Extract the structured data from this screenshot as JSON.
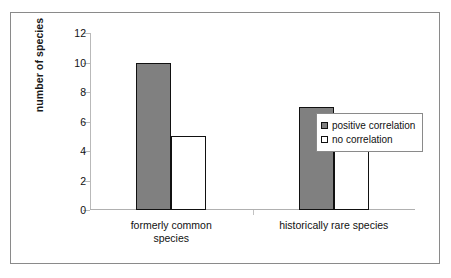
{
  "chart_data": {
    "type": "bar",
    "title": "",
    "xlabel": "",
    "ylabel": "number of species",
    "categories": [
      "formerly common species",
      "historically rare species"
    ],
    "category_lines": [
      [
        "formerly common",
        "species"
      ],
      [
        "historically rare species"
      ]
    ],
    "series": [
      {
        "name": "positive correlation",
        "values": [
          10,
          7
        ],
        "color": "#808080"
      },
      {
        "name": "no correlation",
        "values": [
          5,
          5
        ],
        "color": "#ffffff"
      }
    ],
    "ylim": [
      0,
      12
    ],
    "yticks": [
      0,
      2,
      4,
      6,
      8,
      10,
      12
    ],
    "ytick_labels": [
      "0",
      "2",
      "4",
      "6",
      "8",
      "10",
      "12"
    ],
    "grid": false,
    "legend_position": "right-middle",
    "legend_entries": [
      "positive correlation",
      "no correlation"
    ],
    "frame_color": "#8a8a8a",
    "axis_color": "#b0b0b0",
    "bar_outline_color": "#111111",
    "background_color": "#ffffff"
  }
}
